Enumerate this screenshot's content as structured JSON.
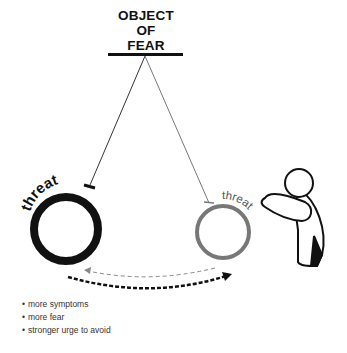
{
  "title": {
    "line1": "OBJECT",
    "line2": "OF FEAR"
  },
  "left_ball": {
    "label": "threat",
    "color": "#111111"
  },
  "right_ball": {
    "label": "threat",
    "color": "#777777"
  },
  "arrows": {
    "thin_dashed": "right-to-left",
    "thick_dashed": "left-to-right"
  },
  "bullets": [
    "more symptoms",
    "more fear",
    "stronger urge to avoid"
  ]
}
